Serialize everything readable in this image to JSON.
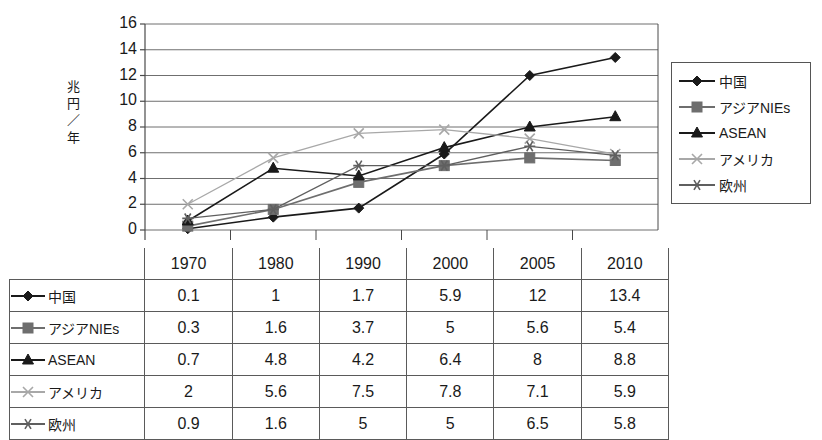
{
  "chart_data": {
    "type": "line",
    "title": "",
    "xlabel": "",
    "ylabel": "兆円／年",
    "categories": [
      "1970",
      "1980",
      "1990",
      "2000",
      "2005",
      "2010"
    ],
    "ylim": [
      0,
      16
    ],
    "ytick_step": 2,
    "yticks": [
      "0",
      "2",
      "4",
      "6",
      "8",
      "10",
      "12",
      "14",
      "16"
    ],
    "grid": "horizontal",
    "legend_position": "right",
    "series": [
      {
        "name": "中国",
        "marker": "diamond",
        "color": "#1a1a1a",
        "values": [
          0.1,
          1,
          1.7,
          5.9,
          12,
          13.4
        ]
      },
      {
        "name": "アジアNIEs",
        "marker": "square",
        "color": "#6e6e6e",
        "values": [
          0.3,
          1.6,
          3.7,
          5,
          5.6,
          5.4
        ]
      },
      {
        "name": "ASEAN",
        "marker": "triangle",
        "color": "#1a1a1a",
        "values": [
          0.7,
          4.8,
          4.2,
          6.4,
          8,
          8.8
        ]
      },
      {
        "name": "アメリカ",
        "marker": "x",
        "color": "#a8a8a8",
        "values": [
          2,
          5.6,
          7.5,
          7.8,
          7.1,
          5.9
        ]
      },
      {
        "name": "欧州",
        "marker": "asterisk",
        "color": "#5f5f5f",
        "values": [
          0.9,
          1.6,
          5,
          5,
          6.5,
          5.8
        ]
      }
    ]
  },
  "table": {
    "corner_label": "",
    "columns": [
      "1970",
      "1980",
      "1990",
      "2000",
      "2005",
      "2010"
    ],
    "rows": [
      {
        "label": "中国",
        "marker": "diamond",
        "color": "#1a1a1a",
        "values": [
          "0.1",
          "1",
          "1.7",
          "5.9",
          "12",
          "13.4"
        ]
      },
      {
        "label": "アジアNIEs",
        "marker": "square",
        "color": "#6e6e6e",
        "values": [
          "0.3",
          "1.6",
          "3.7",
          "5",
          "5.6",
          "5.4"
        ]
      },
      {
        "label": "ASEAN",
        "marker": "triangle",
        "color": "#1a1a1a",
        "values": [
          "0.7",
          "4.8",
          "4.2",
          "6.4",
          "8",
          "8.8"
        ]
      },
      {
        "label": "アメリカ",
        "marker": "x",
        "color": "#a8a8a8",
        "values": [
          "2",
          "5.6",
          "7.5",
          "7.8",
          "7.1",
          "5.9"
        ]
      },
      {
        "label": "欧州",
        "marker": "asterisk",
        "color": "#5f5f5f",
        "values": [
          "0.9",
          "1.6",
          "5",
          "5",
          "6.5",
          "5.8"
        ]
      }
    ]
  },
  "legend": {
    "items": [
      {
        "label": "中国",
        "marker": "diamond",
        "color": "#1a1a1a"
      },
      {
        "label": "アジアNIEs",
        "marker": "square",
        "color": "#6e6e6e"
      },
      {
        "label": "ASEAN",
        "marker": "triangle",
        "color": "#1a1a1a"
      },
      {
        "label": "アメリカ",
        "marker": "x",
        "color": "#a8a8a8"
      },
      {
        "label": "欧州",
        "marker": "asterisk",
        "color": "#5f5f5f"
      }
    ]
  },
  "colors": {
    "grid": "#6f6f6f",
    "axis": "#4a4a4a",
    "table_border": "#5a5a5a",
    "text": "#1a1a1a",
    "background": "#ffffff"
  }
}
